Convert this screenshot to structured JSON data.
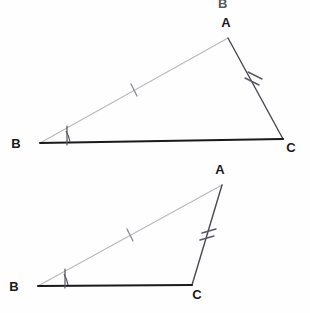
{
  "figure": {
    "kind": "geometry-diagram",
    "width": 310,
    "height": 313,
    "background_color": "#fefefe",
    "colors": {
      "base_line": "#1a1a1a",
      "dark_side": "#4a4a54",
      "light_side": "#b9b9bf",
      "tick_mark": "#6a6a72",
      "angle_arc": "#55555c",
      "label": "#1a1a1a",
      "ghost": "#e9e9e9"
    }
  },
  "bleed_through": {
    "top_fragment": "B",
    "top_fragment_2": "A"
  },
  "triangles": [
    {
      "id": "triangle-top",
      "name": "first-triangle",
      "vertices": {
        "A": {
          "label": "A",
          "x": 228,
          "y": 38,
          "label_x": 226,
          "label_y": 27
        },
        "B": {
          "label": "B",
          "x": 40,
          "y": 143,
          "label_x": 16,
          "label_y": 148
        },
        "C": {
          "label": "C",
          "x": 283,
          "y": 139,
          "label_x": 291,
          "label_y": 152
        }
      },
      "sides": [
        {
          "id": "side-AB",
          "from": "B",
          "to": "A",
          "tick_count": 1,
          "stroke": "#b9b9bf",
          "width": 1.2
        },
        {
          "id": "side-AC",
          "from": "A",
          "to": "C",
          "tick_count": 2,
          "stroke": "#4a4a54",
          "width": 1.4
        },
        {
          "id": "side-BC",
          "from": "B",
          "to": "C",
          "tick_count": 0,
          "stroke": "#1a1a1a",
          "width": 2.0
        }
      ],
      "angle_marks": [
        {
          "id": "angle-B",
          "at": "B",
          "symbol": "arc-with-tick",
          "tick_count": 1
        }
      ]
    },
    {
      "id": "triangle-bottom",
      "name": "second-triangle",
      "vertices": {
        "A": {
          "label": "A",
          "x": 222,
          "y": 185,
          "label_x": 220,
          "label_y": 174
        },
        "B": {
          "label": "B",
          "x": 38,
          "y": 286,
          "label_x": 14,
          "label_y": 291
        },
        "C": {
          "label": "C",
          "x": 192,
          "y": 285,
          "label_x": 197,
          "label_y": 299
        }
      },
      "sides": [
        {
          "id": "side-AB",
          "from": "B",
          "to": "A",
          "tick_count": 1,
          "stroke": "#b9b9bf",
          "width": 1.2
        },
        {
          "id": "side-AC",
          "from": "A",
          "to": "C",
          "tick_count": 2,
          "stroke": "#4a4a54",
          "width": 1.4
        },
        {
          "id": "side-BC",
          "from": "B",
          "to": "C",
          "tick_count": 0,
          "stroke": "#1a1a1a",
          "width": 2.0
        }
      ],
      "angle_marks": [
        {
          "id": "angle-B",
          "at": "B",
          "symbol": "arc-with-tick",
          "tick_count": 1
        }
      ]
    }
  ]
}
